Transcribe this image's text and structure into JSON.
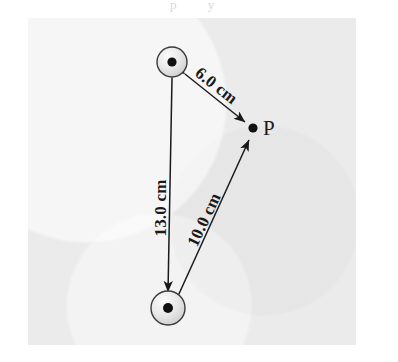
{
  "figure": {
    "caption_bleed": "p y",
    "background_color": "#ffffff",
    "panel_color": "#ebebeb",
    "ink_color": "#1a1a1a"
  },
  "diagram_data": {
    "type": "physics-geometry-diagram",
    "description": "Two spheres connected by a 13.0 cm segment; a field point P located 6.0 cm from the upper sphere and 10.0 cm from the lower sphere.",
    "nodes": [
      {
        "id": "sphere-top",
        "kind": "sphere",
        "label": "",
        "x": 172,
        "y": 62,
        "outer_radius": 15,
        "core_radius": 4.5,
        "fill": "#e4e4e4",
        "stroke": "#333333",
        "core_fill": "#111111"
      },
      {
        "id": "sphere-bottom",
        "kind": "sphere",
        "label": "",
        "x": 168,
        "y": 308,
        "outer_radius": 17,
        "core_radius": 5,
        "fill": "#e0e0e0",
        "stroke": "#333333",
        "core_fill": "#111111"
      },
      {
        "id": "point-p",
        "kind": "point",
        "label": "P",
        "x": 253,
        "y": 128,
        "core_radius": 4.5,
        "core_fill": "#111111"
      }
    ],
    "measurements": [
      {
        "id": "dim-6",
        "label": "6.0 cm",
        "value": 6.0,
        "unit": "cm",
        "from": "sphere-top",
        "to": "point-p",
        "arrow_heads": "both",
        "label_rotation_deg": 38
      },
      {
        "id": "dim-13",
        "label": "13.0 cm",
        "value": 13.0,
        "unit": "cm",
        "from": "sphere-top",
        "to": "sphere-bottom",
        "arrow_heads": "both",
        "label_rotation_deg": -90
      },
      {
        "id": "dim-10",
        "label": "10.0 cm",
        "value": 10.0,
        "unit": "cm",
        "from": "sphere-bottom",
        "to": "point-p",
        "arrow_heads": "both",
        "label_rotation_deg": -61
      }
    ]
  }
}
